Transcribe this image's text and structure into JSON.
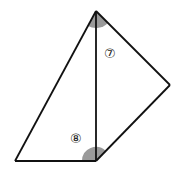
{
  "diagram": {
    "type": "geometry",
    "vertices": {
      "top": [
        96,
        11
      ],
      "bottom_left": [
        15,
        161
      ],
      "bottom_mid": [
        96,
        161
      ],
      "right": [
        170,
        85
      ]
    },
    "angles": [
      {
        "label": "⑦",
        "vertex": "top",
        "shaded": true
      },
      {
        "label": "⑧",
        "vertex": "bottom_mid",
        "shaded": true
      }
    ],
    "colors": {
      "line": "#111111",
      "shade": "#9a9a9a",
      "background": "#ffffff"
    }
  }
}
